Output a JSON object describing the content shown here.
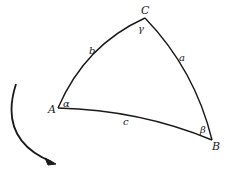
{
  "figure": {
    "line_color": "#1a1a1a",
    "background": "#ffffff"
  },
  "vertices": {
    "A": "A",
    "B": "B",
    "C": "C"
  },
  "sides": {
    "a": "a",
    "b": "b",
    "c": "c"
  },
  "angles": {
    "alpha": "α",
    "beta": "β",
    "gamma": "γ"
  },
  "rotation_arrow": {
    "direction": "counterclockwise-downward"
  }
}
